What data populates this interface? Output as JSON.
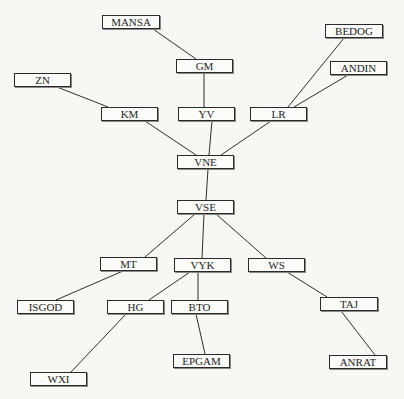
{
  "diagram": {
    "type": "tree",
    "nodes": [
      {
        "id": "MANSA",
        "label": "MANSA",
        "x": 102,
        "y": 15,
        "w": 58
      },
      {
        "id": "GM",
        "label": "GM",
        "x": 176,
        "y": 59,
        "w": 57
      },
      {
        "id": "ZN",
        "label": "ZN",
        "x": 14,
        "y": 73,
        "w": 57
      },
      {
        "id": "BEDOG",
        "label": "BEDOG",
        "x": 325,
        "y": 24,
        "w": 58
      },
      {
        "id": "ANDIN",
        "label": "ANDIN",
        "x": 330,
        "y": 61,
        "w": 57
      },
      {
        "id": "KM",
        "label": "KM",
        "x": 101,
        "y": 107,
        "w": 57
      },
      {
        "id": "YV",
        "label": "YV",
        "x": 178,
        "y": 107,
        "w": 57
      },
      {
        "id": "LR",
        "label": "LR",
        "x": 250,
        "y": 107,
        "w": 57
      },
      {
        "id": "VNE",
        "label": "VNE",
        "x": 177,
        "y": 155,
        "w": 57
      },
      {
        "id": "VSE",
        "label": "VSE",
        "x": 177,
        "y": 200,
        "w": 57
      },
      {
        "id": "MT",
        "label": "MT",
        "x": 100,
        "y": 257,
        "w": 57
      },
      {
        "id": "VYK",
        "label": "VYK",
        "x": 174,
        "y": 258,
        "w": 57
      },
      {
        "id": "WS",
        "label": "WS",
        "x": 248,
        "y": 258,
        "w": 57
      },
      {
        "id": "ISGOD",
        "label": "ISGOD",
        "x": 17,
        "y": 300,
        "w": 57
      },
      {
        "id": "HG",
        "label": "HG",
        "x": 107,
        "y": 300,
        "w": 57
      },
      {
        "id": "BTO",
        "label": "BTO",
        "x": 171,
        "y": 300,
        "w": 57
      },
      {
        "id": "TAJ",
        "label": "TAJ",
        "x": 320,
        "y": 297,
        "w": 58
      },
      {
        "id": "EPGAM",
        "label": "EPGAM",
        "x": 173,
        "y": 354,
        "w": 57
      },
      {
        "id": "WXI",
        "label": "WXI",
        "x": 30,
        "y": 372,
        "w": 57
      },
      {
        "id": "ANRAT",
        "label": "ANRAT",
        "x": 329,
        "y": 355,
        "w": 58
      }
    ],
    "edges": [
      {
        "from": "MANSA",
        "to": "GM",
        "x1": 153,
        "y1": 29,
        "x2": 196,
        "y2": 59
      },
      {
        "from": "GM",
        "to": "YV",
        "x1": 204,
        "y1": 73,
        "x2": 204,
        "y2": 107
      },
      {
        "from": "ZN",
        "to": "KM",
        "x1": 57,
        "y1": 87,
        "x2": 108,
        "y2": 107
      },
      {
        "from": "BEDOG",
        "to": "LR",
        "x1": 344,
        "y1": 38,
        "x2": 288,
        "y2": 107
      },
      {
        "from": "ANDIN",
        "to": "LR",
        "x1": 348,
        "y1": 75,
        "x2": 294,
        "y2": 107
      },
      {
        "from": "KM",
        "to": "VNE",
        "x1": 145,
        "y1": 121,
        "x2": 196,
        "y2": 155
      },
      {
        "from": "YV",
        "to": "VNE",
        "x1": 212,
        "y1": 121,
        "x2": 209,
        "y2": 155
      },
      {
        "from": "LR",
        "to": "VNE",
        "x1": 271,
        "y1": 121,
        "x2": 221,
        "y2": 155
      },
      {
        "from": "VNE",
        "to": "VSE",
        "x1": 208,
        "y1": 169,
        "x2": 206,
        "y2": 200
      },
      {
        "from": "VSE",
        "to": "MT",
        "x1": 195,
        "y1": 214,
        "x2": 145,
        "y2": 257
      },
      {
        "from": "VSE",
        "to": "VYK",
        "x1": 204,
        "y1": 214,
        "x2": 202,
        "y2": 258
      },
      {
        "from": "VSE",
        "to": "WS",
        "x1": 216,
        "y1": 214,
        "x2": 266,
        "y2": 258
      },
      {
        "from": "MT",
        "to": "ISGOD",
        "x1": 123,
        "y1": 271,
        "x2": 56,
        "y2": 300
      },
      {
        "from": "VYK",
        "to": "HG",
        "x1": 190,
        "y1": 272,
        "x2": 149,
        "y2": 300
      },
      {
        "from": "VYK",
        "to": "BTO",
        "x1": 198,
        "y1": 272,
        "x2": 198,
        "y2": 300
      },
      {
        "from": "BTO",
        "to": "EPGAM",
        "x1": 196,
        "y1": 314,
        "x2": 205,
        "y2": 354
      },
      {
        "from": "HG",
        "to": "WXI",
        "x1": 126,
        "y1": 314,
        "x2": 71,
        "y2": 372
      },
      {
        "from": "WS",
        "to": "TAJ",
        "x1": 287,
        "y1": 272,
        "x2": 327,
        "y2": 297
      },
      {
        "from": "TAJ",
        "to": "ANRAT",
        "x1": 341,
        "y1": 311,
        "x2": 375,
        "y2": 355
      }
    ]
  }
}
